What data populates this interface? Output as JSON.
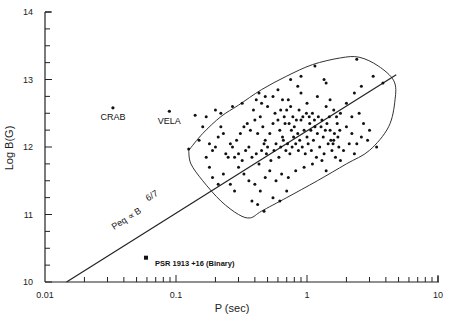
{
  "chart_data": {
    "type": "scatter",
    "title": "",
    "xlabel": "P (sec)",
    "ylabel": "Log B(G)",
    "xscale": "log",
    "xlim": [
      0.01,
      10
    ],
    "ylim": [
      10,
      14
    ],
    "x_ticks": [
      "0.01",
      "0.1",
      "1",
      "10"
    ],
    "y_ticks": [
      "10",
      "11",
      "12",
      "13",
      "14"
    ],
    "grid": false,
    "legend": null,
    "annotations": [
      {
        "text": "CRAB",
        "P": 0.033,
        "logB": 12.58
      },
      {
        "text": "VELA",
        "P": 0.089,
        "logB": 12.53
      },
      {
        "text": "PSR 1913 +16 (Binary)",
        "P": 0.059,
        "logB": 10.36
      },
      {
        "text": "Peq ∝ B^(6/7)",
        "kind": "line-label"
      }
    ],
    "line": {
      "label": "Peq ∝ B 6/7",
      "points": [
        {
          "P": 0.0146,
          "logB": 10.0
        },
        {
          "P": 4.8,
          "logB": 13.07
        }
      ]
    },
    "special_points": [
      {
        "name": "CRAB",
        "P": 0.033,
        "logB": 12.58
      },
      {
        "name": "VELA",
        "P": 0.089,
        "logB": 12.53
      },
      {
        "name": "PSR 1913+16",
        "P": 0.059,
        "logB": 10.36
      }
    ],
    "envelope": [
      [
        0.125,
        11.95
      ],
      [
        0.16,
        12.2
      ],
      [
        0.22,
        12.45
      ],
      [
        0.3,
        12.62
      ],
      [
        0.45,
        12.85
      ],
      [
        0.7,
        13.05
      ],
      [
        1.1,
        13.22
      ],
      [
        1.8,
        13.32
      ],
      [
        2.5,
        13.33
      ],
      [
        3.5,
        13.2
      ],
      [
        4.6,
        12.98
      ],
      [
        4.7,
        12.7
      ],
      [
        4.2,
        12.3
      ],
      [
        3.0,
        11.95
      ],
      [
        2.0,
        11.75
      ],
      [
        1.2,
        11.5
      ],
      [
        0.7,
        11.25
      ],
      [
        0.45,
        11.05
      ],
      [
        0.37,
        10.95
      ],
      [
        0.3,
        11.0
      ],
      [
        0.22,
        11.2
      ],
      [
        0.16,
        11.5
      ],
      [
        0.13,
        11.75
      ],
      [
        0.125,
        11.95
      ]
    ],
    "points": [
      [
        0.14,
        12.47
      ],
      [
        0.125,
        11.97
      ],
      [
        0.15,
        12.1
      ],
      [
        0.18,
        12.05
      ],
      [
        0.2,
        12.0
      ],
      [
        0.19,
        11.95
      ],
      [
        0.21,
        12.15
      ],
      [
        0.22,
        12.3
      ],
      [
        0.23,
        12.2
      ],
      [
        0.24,
        11.9
      ],
      [
        0.25,
        11.85
      ],
      [
        0.27,
        12.0
      ],
      [
        0.28,
        11.85
      ],
      [
        0.3,
        11.9
      ],
      [
        0.32,
        11.8
      ],
      [
        0.17,
        11.85
      ],
      [
        0.16,
        12.3
      ],
      [
        0.2,
        12.55
      ],
      [
        0.26,
        12.05
      ],
      [
        0.29,
        12.1
      ],
      [
        0.31,
        12.2
      ],
      [
        0.33,
        12.3
      ],
      [
        0.35,
        12.35
      ],
      [
        0.37,
        12.25
      ],
      [
        0.4,
        12.4
      ],
      [
        0.42,
        12.2
      ],
      [
        0.44,
        12.45
      ],
      [
        0.46,
        12.3
      ],
      [
        0.48,
        12.1
      ],
      [
        0.5,
        12.0
      ],
      [
        0.52,
        12.2
      ],
      [
        0.55,
        12.35
      ],
      [
        0.57,
        12.5
      ],
      [
        0.6,
        12.4
      ],
      [
        0.62,
        12.25
      ],
      [
        0.65,
        12.15
      ],
      [
        0.68,
        12.35
      ],
      [
        0.7,
        12.55
      ],
      [
        0.72,
        12.7
      ],
      [
        0.75,
        12.6
      ],
      [
        0.78,
        12.45
      ],
      [
        0.8,
        12.3
      ],
      [
        0.85,
        12.2
      ],
      [
        0.9,
        12.4
      ],
      [
        0.95,
        12.25
      ],
      [
        1.0,
        12.15
      ],
      [
        1.05,
        12.35
      ],
      [
        1.1,
        12.5
      ],
      [
        1.15,
        12.3
      ],
      [
        1.2,
        12.2
      ],
      [
        1.3,
        12.4
      ],
      [
        1.4,
        12.6
      ],
      [
        1.5,
        12.25
      ],
      [
        1.6,
        12.1
      ],
      [
        1.7,
        12.35
      ],
      [
        1.8,
        12.5
      ],
      [
        2.0,
        12.3
      ],
      [
        2.2,
        12.2
      ],
      [
        2.4,
        12.05
      ],
      [
        2.6,
        12.15
      ],
      [
        0.34,
        11.95
      ],
      [
        0.36,
        12.0
      ],
      [
        0.38,
        11.85
      ],
      [
        0.41,
        11.9
      ],
      [
        0.43,
        11.75
      ],
      [
        0.45,
        11.95
      ],
      [
        0.47,
        12.05
      ],
      [
        0.49,
        11.9
      ],
      [
        0.53,
        11.8
      ],
      [
        0.56,
        11.95
      ],
      [
        0.58,
        12.05
      ],
      [
        0.61,
        11.85
      ],
      [
        0.63,
        12.0
      ],
      [
        0.66,
        12.1
      ],
      [
        0.69,
        11.95
      ],
      [
        0.71,
        12.05
      ],
      [
        0.74,
        11.9
      ],
      [
        0.77,
        12.0
      ],
      [
        0.79,
        12.15
      ],
      [
        0.82,
        12.05
      ],
      [
        0.86,
        11.95
      ],
      [
        0.88,
        12.1
      ],
      [
        0.92,
        12.0
      ],
      [
        0.97,
        11.9
      ],
      [
        1.02,
        12.05
      ],
      [
        1.08,
        11.95
      ],
      [
        1.12,
        12.1
      ],
      [
        1.18,
        11.85
      ],
      [
        1.25,
        12.0
      ],
      [
        1.35,
        11.9
      ],
      [
        1.45,
        12.05
      ],
      [
        1.55,
        11.95
      ],
      [
        1.65,
        11.85
      ],
      [
        1.75,
        12.0
      ],
      [
        1.9,
        11.95
      ],
      [
        2.1,
        12.05
      ],
      [
        0.3,
        11.7
      ],
      [
        0.33,
        11.6
      ],
      [
        0.36,
        11.5
      ],
      [
        0.4,
        11.45
      ],
      [
        0.44,
        11.35
      ],
      [
        0.48,
        11.55
      ],
      [
        0.52,
        11.65
      ],
      [
        0.58,
        11.5
      ],
      [
        0.64,
        11.6
      ],
      [
        0.72,
        11.55
      ],
      [
        0.82,
        11.65
      ],
      [
        0.95,
        11.7
      ],
      [
        1.1,
        11.75
      ],
      [
        1.3,
        11.8
      ],
      [
        0.42,
        11.15
      ],
      [
        0.47,
        11.05
      ],
      [
        0.55,
        11.25
      ],
      [
        0.62,
        11.2
      ],
      [
        0.7,
        11.35
      ],
      [
        0.38,
        11.2
      ],
      [
        0.26,
        11.45
      ],
      [
        0.28,
        11.35
      ],
      [
        0.5,
        12.6
      ],
      [
        0.55,
        12.75
      ],
      [
        0.6,
        12.85
      ],
      [
        0.65,
        12.7
      ],
      [
        0.85,
        12.9
      ],
      [
        0.9,
        12.8
      ],
      [
        1.0,
        12.65
      ],
      [
        1.2,
        12.75
      ],
      [
        1.5,
        12.7
      ],
      [
        1.6,
        12.55
      ],
      [
        2.0,
        12.65
      ],
      [
        2.3,
        12.8
      ],
      [
        2.6,
        12.9
      ],
      [
        1.35,
        13.0
      ],
      [
        1.4,
        12.95
      ],
      [
        0.75,
        13.0
      ],
      [
        0.9,
        13.05
      ],
      [
        1.15,
        13.2
      ],
      [
        2.4,
        13.3
      ],
      [
        3.2,
        13.05
      ],
      [
        3.8,
        12.95
      ],
      [
        2.2,
        12.45
      ],
      [
        2.5,
        12.5
      ],
      [
        2.7,
        12.35
      ],
      [
        3.0,
        12.25
      ],
      [
        2.9,
        12.1
      ],
      [
        3.4,
        12.0
      ],
      [
        2.3,
        11.9
      ],
      [
        1.8,
        11.8
      ],
      [
        1.4,
        11.65
      ],
      [
        0.23,
        11.6
      ],
      [
        0.21,
        11.45
      ],
      [
        0.19,
        11.55
      ],
      [
        0.18,
        11.7
      ],
      [
        0.17,
        12.45
      ],
      [
        0.22,
        12.5
      ],
      [
        0.27,
        12.6
      ],
      [
        0.32,
        12.65
      ],
      [
        0.45,
        12.65
      ],
      [
        0.39,
        12.55
      ],
      [
        0.41,
        12.7
      ],
      [
        0.43,
        12.8
      ],
      [
        0.48,
        12.75
      ],
      [
        0.63,
        12.55
      ],
      [
        0.67,
        12.45
      ],
      [
        0.73,
        12.35
      ],
      [
        0.76,
        12.25
      ],
      [
        0.83,
        12.4
      ],
      [
        0.87,
        12.55
      ],
      [
        0.93,
        12.45
      ],
      [
        0.99,
        12.5
      ],
      [
        1.04,
        12.45
      ],
      [
        1.07,
        12.25
      ],
      [
        1.14,
        12.4
      ],
      [
        1.22,
        12.45
      ],
      [
        1.28,
        12.3
      ],
      [
        1.33,
        12.15
      ],
      [
        1.38,
        12.25
      ],
      [
        1.42,
        12.35
      ],
      [
        1.48,
        12.45
      ],
      [
        1.52,
        12.1
      ],
      [
        1.58,
        12.05
      ],
      [
        1.62,
        12.2
      ],
      [
        1.68,
        12.45
      ],
      [
        1.72,
        12.15
      ],
      [
        1.78,
        12.25
      ]
    ]
  }
}
